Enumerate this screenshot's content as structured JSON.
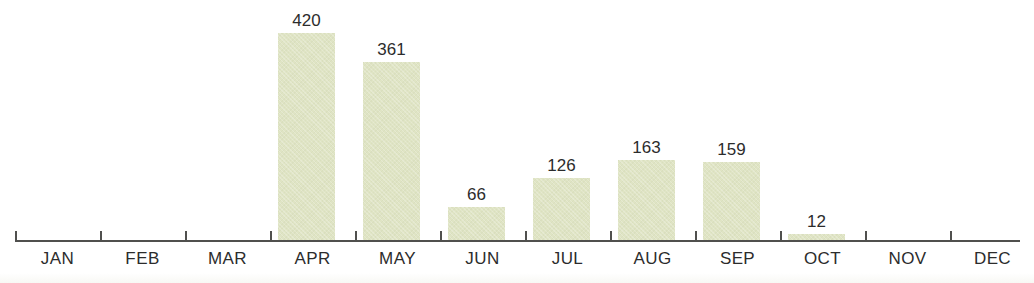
{
  "chart_data": {
    "type": "bar",
    "title": "",
    "subtitle": "",
    "xlabel": "",
    "ylabel": "",
    "categories": [
      "JAN",
      "FEB",
      "MAR",
      "APR",
      "MAY",
      "JUN",
      "JUL",
      "AUG",
      "SEP",
      "OCT",
      "NOV",
      "DEC"
    ],
    "values": [
      0,
      0,
      0,
      420,
      361,
      66,
      126,
      163,
      159,
      12,
      0,
      0
    ],
    "value_labels": [
      "",
      "",
      "",
      "420",
      "361",
      "66",
      "126",
      "163",
      "159",
      "12",
      "",
      ""
    ],
    "ylim": [
      0,
      420
    ],
    "grid": false,
    "legend": null,
    "legend_position": "none",
    "axis": {
      "show_x_axis_line": true,
      "show_y_axis_line": false,
      "tick_marks": true,
      "tick_labels": [
        "JAN",
        "FEB",
        "MAR",
        "APR",
        "MAY",
        "JUN",
        "JUL",
        "AUG",
        "SEP",
        "OCT",
        "NOV",
        "DEC"
      ]
    },
    "annotations": []
  },
  "style": {
    "bar_color": "#dfe4c4",
    "axis_color": "#50504e",
    "text_color": "#2c2c2c",
    "background_color": "#ffffff"
  },
  "geometry": {
    "baseline_y": 240,
    "tick_start_x": 15,
    "tick_spacing": 85,
    "bar_width": 57,
    "bar_offset": 8,
    "axis_end_x": 1020,
    "max_bar_height": 207,
    "max_value": 420,
    "tick_height": 9
  }
}
